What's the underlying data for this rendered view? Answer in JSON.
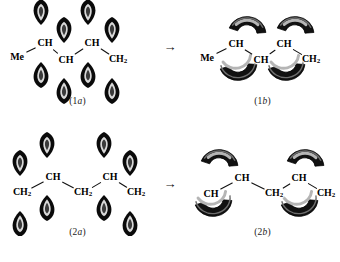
{
  "figure": {
    "background": "#ffffff",
    "ink": "#000000"
  },
  "reaction_arrow": {
    "glyph": "→",
    "name": "rightwards-arrow"
  },
  "rows": [
    {
      "id": "row-1",
      "left": {
        "caption_prefix": "(1",
        "caption_italic": "a",
        "caption_suffix": ")",
        "caption": "(1a)",
        "labels": [
          {
            "text": "Me",
            "sub": "",
            "x": 17,
            "y": 57
          },
          {
            "text": "CH",
            "sub": "",
            "x": 45,
            "y": 43
          },
          {
            "text": "CH",
            "sub": "",
            "x": 66,
            "y": 60
          },
          {
            "text": "CH",
            "sub": "",
            "x": 92,
            "y": 43
          },
          {
            "text": "CH",
            "sub": "2",
            "x": 118,
            "y": 60
          }
        ],
        "orbital_style": "p-orbital-teardrop",
        "orbitals": [
          {
            "x": 41,
            "y": 25,
            "dir": "up"
          },
          {
            "x": 41,
            "y": 62,
            "dir": "down"
          },
          {
            "x": 64,
            "y": 43,
            "dir": "up"
          },
          {
            "x": 64,
            "y": 78,
            "dir": "down"
          },
          {
            "x": 88,
            "y": 25,
            "dir": "up"
          },
          {
            "x": 88,
            "y": 62,
            "dir": "down"
          },
          {
            "x": 112,
            "y": 43,
            "dir": "up"
          },
          {
            "x": 112,
            "y": 78,
            "dir": "down"
          }
        ]
      },
      "right": {
        "caption_prefix": "(1",
        "caption_italic": "b",
        "caption_suffix": ")",
        "caption": "(1b)",
        "labels": [
          {
            "text": "Me",
            "sub": "",
            "x": 22,
            "y": 58
          },
          {
            "text": "CH",
            "sub": "",
            "x": 51,
            "y": 44
          },
          {
            "text": "CH",
            "sub": "",
            "x": 76,
            "y": 60
          },
          {
            "text": "CH",
            "sub": "",
            "x": 99,
            "y": 44
          },
          {
            "text": "CH",
            "sub": "2",
            "x": 126,
            "y": 60
          }
        ],
        "orbital_style": "banana-bond-crescent",
        "orbitals": [
          {
            "x": 62,
            "y": 34,
            "dir": "up"
          },
          {
            "x": 53,
            "y": 63,
            "dir": "down"
          },
          {
            "x": 110,
            "y": 34,
            "dir": "up"
          },
          {
            "x": 101,
            "y": 63,
            "dir": "down"
          }
        ]
      }
    },
    {
      "id": "row-2",
      "left": {
        "caption_prefix": "(2",
        "caption_italic": "a",
        "caption_suffix": ")",
        "caption": "(2a)",
        "labels": [
          {
            "text": "CH",
            "sub": "2",
            "x": 22,
            "y": 62
          },
          {
            "text": "CH",
            "sub": "",
            "x": 53,
            "y": 46
          },
          {
            "text": "CH",
            "sub": "2",
            "x": 83,
            "y": 62
          },
          {
            "text": "CH",
            "sub": "",
            "x": 110,
            "y": 46
          },
          {
            "text": "CH",
            "sub": "2",
            "x": 136,
            "y": 62
          }
        ],
        "orbital_style": "p-orbital-teardrop",
        "orbitals": [
          {
            "x": 20,
            "y": 45,
            "dir": "up"
          },
          {
            "x": 20,
            "y": 80,
            "dir": "down"
          },
          {
            "x": 47,
            "y": 27,
            "dir": "up"
          },
          {
            "x": 47,
            "y": 64,
            "dir": "down"
          },
          {
            "x": 104,
            "y": 27,
            "dir": "up"
          },
          {
            "x": 104,
            "y": 64,
            "dir": "down"
          },
          {
            "x": 130,
            "y": 45,
            "dir": "up"
          },
          {
            "x": 130,
            "y": 80,
            "dir": "down"
          }
        ]
      },
      "right": {
        "caption_prefix": "(2",
        "caption_italic": "b",
        "caption_suffix": ")",
        "caption": "(2b)",
        "labels": [
          {
            "text": "CH",
            "sub": "",
            "x": 26,
            "y": 63
          },
          {
            "text": "CH",
            "sub": "",
            "x": 57,
            "y": 47
          },
          {
            "text": "CH",
            "sub": "2",
            "x": 89,
            "y": 63
          },
          {
            "text": "CH",
            "sub": "",
            "x": 114,
            "y": 47
          },
          {
            "text": "CH",
            "sub": "2",
            "x": 141,
            "y": 63
          }
        ],
        "orbital_style": "banana-bond-crescent",
        "orbitals": [
          {
            "x": 34,
            "y": 36,
            "dir": "up"
          },
          {
            "x": 28,
            "y": 68,
            "dir": "down"
          },
          {
            "x": 120,
            "y": 36,
            "dir": "up"
          },
          {
            "x": 114,
            "y": 68,
            "dir": "down"
          }
        ]
      }
    }
  ]
}
